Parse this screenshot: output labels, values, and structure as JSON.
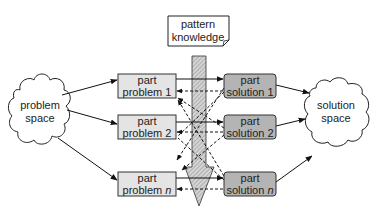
{
  "pattern_knowledge": {
    "line1": "pattern",
    "line2": "knowledge"
  },
  "problem_space": {
    "line1": "problem",
    "line2": "space"
  },
  "solution_space": {
    "line1": "solution",
    "line2": "space"
  },
  "problems": [
    {
      "line1": "part",
      "line2": "problem 1"
    },
    {
      "line1": "part",
      "line2": "problem 2"
    },
    {
      "line1": "part",
      "line2": "problem ",
      "italic": "n"
    }
  ],
  "solutions": [
    {
      "line1": "part",
      "line2": "solution 1"
    },
    {
      "line1": "part",
      "line2": "solution 2"
    },
    {
      "line1": "part",
      "line2": "solution ",
      "italic": "n"
    }
  ],
  "colors": {
    "problem_box": "#e4e4e4",
    "solution_box": "#b4b4b4",
    "hatch": "#bdbdbd",
    "stroke": "#222222"
  }
}
